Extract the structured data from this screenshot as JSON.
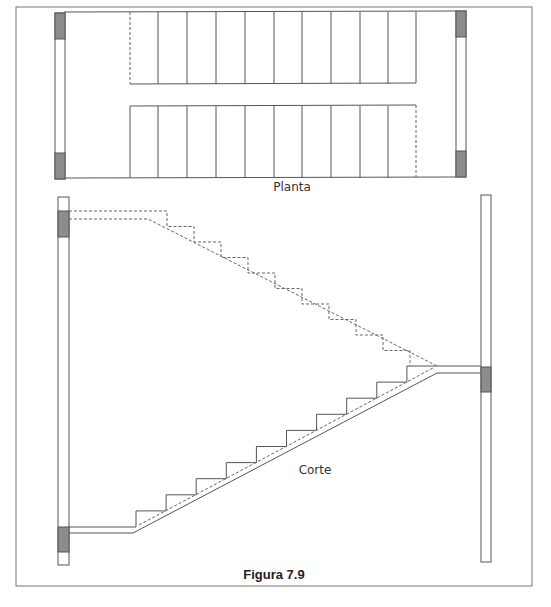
{
  "figure": {
    "caption": "Figura 7.9",
    "frame": {
      "x": 16,
      "y": 7,
      "w": 516,
      "h": 579
    },
    "colors": {
      "line": "#555555",
      "wall_fill": "#ffffff",
      "column_fill": "#8c8c8c",
      "dashed": "#666666"
    }
  },
  "plan": {
    "label": "Planta",
    "label_pos": {
      "x": 292,
      "y": 191
    },
    "outline": {
      "x": 64,
      "y": 12,
      "w": 403,
      "h": 166
    },
    "left_wall": {
      "x": 55,
      "y": 13,
      "w": 10,
      "h": 166
    },
    "right_wall": {
      "x": 456,
      "y": 11,
      "w": 10,
      "h": 166
    },
    "columns": [
      {
        "x": 55,
        "y": 13,
        "w": 10,
        "h": 26
      },
      {
        "x": 55,
        "y": 153,
        "w": 10,
        "h": 26
      },
      {
        "x": 456,
        "y": 11,
        "w": 10,
        "h": 26
      },
      {
        "x": 456,
        "y": 151,
        "w": 10,
        "h": 26
      }
    ],
    "beam": {
      "x1": 130,
      "x2": 416,
      "y_top": 84,
      "y_bottom": 106
    },
    "tread_lines_x": [
      158,
      187,
      216,
      245,
      274,
      302,
      331,
      360,
      388
    ],
    "dashed_top_x": 130,
    "dashed_bottom_x": 416
  },
  "section": {
    "label": "Corte",
    "label_pos": {
      "x": 315,
      "y": 474
    },
    "left_wall": {
      "x": 58,
      "y": 197,
      "w": 11,
      "h": 368
    },
    "right_wall": {
      "x": 481,
      "y": 195,
      "w": 10,
      "h": 367
    },
    "columns": [
      {
        "x": 58,
        "y": 211,
        "w": 11,
        "h": 26
      },
      {
        "x": 58,
        "y": 527,
        "w": 11,
        "h": 25
      },
      {
        "x": 481,
        "y": 367,
        "w": 10,
        "h": 25
      }
    ],
    "upper_flight_dashed": {
      "landing_top_y": 211,
      "landing_bottom_y": 219,
      "steps": 10,
      "start_x": 69,
      "first_riser_x": 167,
      "end_x": 437,
      "end_y": 366,
      "soffit_start_x": 148
    },
    "lower_flight": {
      "floor_y": 527,
      "soffit_y": 533,
      "start_x": 69,
      "first_riser_x": 136,
      "steps": 10,
      "step_w": 30,
      "step_h": 16,
      "soffit_bend_x": 133,
      "top_landing_y": 366,
      "top_soffit_y": 373,
      "top_x": 437,
      "wall_x": 481
    }
  }
}
